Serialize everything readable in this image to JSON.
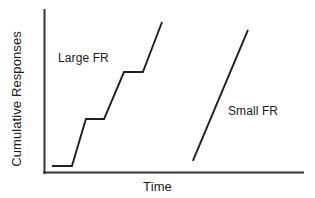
{
  "figure": {
    "background_color": "#ffffff",
    "line_color": "#1f1f1f",
    "axis_color": "#343434"
  },
  "axes": {
    "x_label": "Time",
    "y_label": "Cumulative Responses"
  },
  "annotations": {
    "large_fr_label": "Large FR",
    "small_fr_label": "Small FR"
  },
  "chart_data": {
    "type": "line",
    "title": "",
    "xlabel": "Time",
    "ylabel": "Cumulative Responses",
    "xlim": [
      0,
      100
    ],
    "ylim": [
      0,
      100
    ],
    "grid": false,
    "axis_ticks": {
      "x": [],
      "y": []
    },
    "legend": {
      "position": "inline-annotations",
      "entries": [
        "Large FR",
        "Small FR"
      ]
    },
    "series": [
      {
        "name": "Large FR",
        "description": "Cumulative record with long post-reinforcement pauses (flat plateaus) separating steep response runs, producing a staircase pattern.",
        "annotation": "Large FR",
        "annotation_xy": [
          10,
          70
        ],
        "points": [
          {
            "x": 3.1,
            "y": 4.3
          },
          {
            "x": 10.8,
            "y": 4.3
          },
          {
            "x": 16.2,
            "y": 33.1
          },
          {
            "x": 23.2,
            "y": 33.1
          },
          {
            "x": 30.9,
            "y": 61.9
          },
          {
            "x": 38.2,
            "y": 61.9
          },
          {
            "x": 45.6,
            "y": 92.6
          }
        ]
      },
      {
        "name": "Small FR",
        "description": "Cumulative record with a steady high rate of responding and no visible pauses, producing a single steep straight line.",
        "annotation": "Small FR",
        "annotation_xy": [
          71,
          37
        ],
        "points": [
          {
            "x": 57.5,
            "y": 7.4
          },
          {
            "x": 78.8,
            "y": 87.7
          }
        ]
      }
    ]
  }
}
